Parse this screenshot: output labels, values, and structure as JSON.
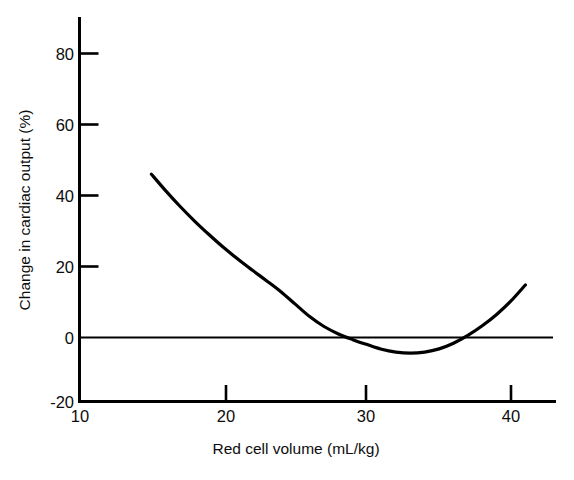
{
  "figure": {
    "background_color": "#ffffff",
    "ink_color": "#000000"
  },
  "chart_data": {
    "type": "line",
    "title": "",
    "subtitle": "",
    "xlabel": "Red cell volume (mL/kg)",
    "ylabel": "Change in cardiac output (%)",
    "xlim": [
      10,
      43.5
    ],
    "ylim": [
      -20,
      88
    ],
    "xticks": [
      10,
      20,
      30,
      40
    ],
    "xtick_labels": [
      "10",
      "20",
      "30",
      "40"
    ],
    "yticks": [
      -20,
      0,
      20,
      40,
      60,
      80
    ],
    "ytick_labels": [
      "-20",
      "0",
      "20",
      "40",
      "60",
      "80"
    ],
    "grid": false,
    "legend": null,
    "legend_position": "none",
    "annotations": [],
    "reference_lines": [
      {
        "name": "zero-line",
        "orientation": "horizontal",
        "value": 0,
        "x_start": 10,
        "x_end": 42.5,
        "color": "#000000"
      }
    ],
    "series": [
      {
        "name": "Change in cardiac output vs red cell volume",
        "color": "#000000",
        "line_width": 3.2,
        "marker": "none",
        "x": [
          15.0,
          16.0,
          17.0,
          18.0,
          19.0,
          20.0,
          21.0,
          22.0,
          23.0,
          24.0,
          25.0,
          26.0,
          27.0,
          28.0,
          29.0,
          30.0,
          31.0,
          32.0,
          33.0,
          34.0,
          35.0,
          36.0,
          37.0,
          38.0,
          39.0,
          40.0,
          41.0
        ],
        "y": [
          46.0,
          41.3,
          36.9,
          32.8,
          29.0,
          25.4,
          22.1,
          19.0,
          16.0,
          12.9,
          9.4,
          5.9,
          3.1,
          1.0,
          -0.6,
          -2.0,
          -3.3,
          -4.1,
          -4.4,
          -4.1,
          -3.2,
          -1.6,
          0.6,
          3.3,
          6.5,
          10.3,
          14.8
        ]
      }
    ]
  }
}
